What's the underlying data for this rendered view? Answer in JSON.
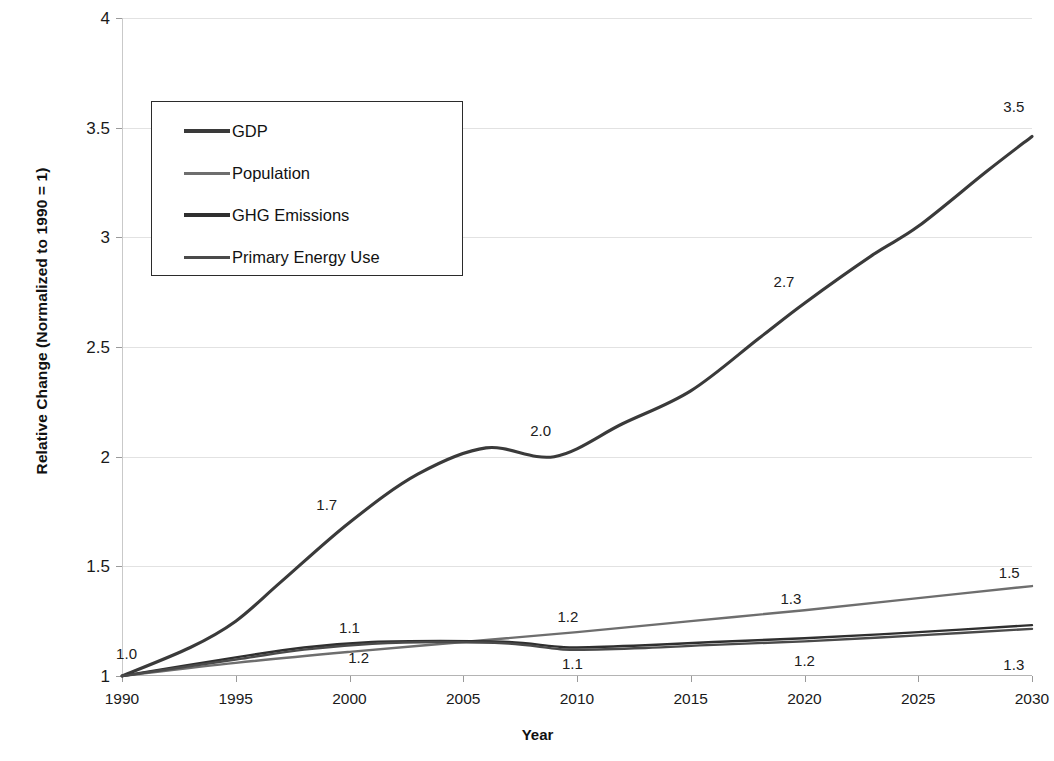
{
  "chart_data": {
    "type": "line",
    "title": "",
    "xlabel": "Year",
    "ylabel": "Relative Change (Normalized to 1990 = 1)",
    "xlim": [
      1990,
      2030
    ],
    "ylim": [
      1,
      4
    ],
    "xticks": [
      "1990",
      "1995",
      "2000",
      "2005",
      "2010",
      "2015",
      "2020",
      "2025",
      "2030"
    ],
    "yticks": [
      "1",
      "1.5",
      "2",
      "2.5",
      "3",
      "3.5",
      "4"
    ],
    "grid": "horizontal",
    "legend_position": "upper-left-inside",
    "x": [
      1990,
      1995,
      2000,
      2005,
      2010,
      2015,
      2020,
      2025,
      2030
    ],
    "series": [
      {
        "name": "GDP",
        "color": "#3a3a3a",
        "values": [
          1.0,
          1.25,
          1.7,
          2.0,
          2.0,
          2.3,
          2.7,
          3.05,
          3.46
        ],
        "points": [
          [
            1990,
            1.0
          ],
          [
            1993,
            1.13
          ],
          [
            1995,
            1.25
          ],
          [
            1997,
            1.43
          ],
          [
            2000,
            1.7
          ],
          [
            2003,
            1.92
          ],
          [
            2006,
            2.04
          ],
          [
            2009,
            2.0
          ],
          [
            2012,
            2.15
          ],
          [
            2015,
            2.3
          ],
          [
            2018,
            2.54
          ],
          [
            2020,
            2.7
          ],
          [
            2023,
            2.92
          ],
          [
            2025,
            3.05
          ],
          [
            2028,
            3.3
          ],
          [
            2030,
            3.46
          ]
        ]
      },
      {
        "name": "Population",
        "color": "#6e6e6e",
        "values": [
          1.0,
          1.06,
          1.11,
          1.15,
          1.2,
          1.25,
          1.3,
          1.36,
          1.41
        ],
        "points": [
          [
            1990,
            1.0
          ],
          [
            1995,
            1.06
          ],
          [
            2000,
            1.11
          ],
          [
            2005,
            1.155
          ],
          [
            2010,
            1.2
          ],
          [
            2015,
            1.25
          ],
          [
            2020,
            1.3
          ],
          [
            2025,
            1.355
          ],
          [
            2030,
            1.41
          ]
        ]
      },
      {
        "name": "GHG Emissions",
        "color": "#2f2f2f",
        "values": [
          1.0,
          1.08,
          1.14,
          1.16,
          1.13,
          1.15,
          1.17,
          1.2,
          1.23
        ],
        "points": [
          [
            1990,
            1.0
          ],
          [
            1995,
            1.085
          ],
          [
            1998,
            1.13
          ],
          [
            2001,
            1.155
          ],
          [
            2004,
            1.16
          ],
          [
            2007,
            1.155
          ],
          [
            2009,
            1.135
          ],
          [
            2010,
            1.13
          ],
          [
            2013,
            1.14
          ],
          [
            2016,
            1.155
          ],
          [
            2020,
            1.172
          ],
          [
            2025,
            1.2
          ],
          [
            2030,
            1.232
          ]
        ]
      },
      {
        "name": "Primary Energy Use",
        "color": "#4a4a4a",
        "values": [
          1.0,
          1.07,
          1.13,
          1.155,
          1.12,
          1.135,
          1.155,
          1.185,
          1.215
        ],
        "points": [
          [
            1990,
            1.0
          ],
          [
            1995,
            1.075
          ],
          [
            1998,
            1.12
          ],
          [
            2001,
            1.147
          ],
          [
            2004,
            1.155
          ],
          [
            2007,
            1.148
          ],
          [
            2009,
            1.125
          ],
          [
            2010,
            1.12
          ],
          [
            2013,
            1.128
          ],
          [
            2016,
            1.142
          ],
          [
            2020,
            1.158
          ],
          [
            2025,
            1.185
          ],
          [
            2030,
            1.215
          ]
        ]
      }
    ],
    "annotations": [
      {
        "text": "1.0",
        "x": 1990.2,
        "y": 1.105,
        "name": "label-1990-all"
      },
      {
        "text": "1.7",
        "x": 1999.0,
        "y": 1.785,
        "name": "label-2000-gdp"
      },
      {
        "text": "2.0",
        "x": 2008.4,
        "y": 2.12,
        "name": "label-2009-gdp"
      },
      {
        "text": "2.7",
        "x": 2019.1,
        "y": 2.8,
        "name": "label-2020-gdp"
      },
      {
        "text": "3.5",
        "x": 2029.2,
        "y": 3.6,
        "name": "label-2030-gdp"
      },
      {
        "text": "1.1",
        "x": 2000.0,
        "y": 1.225,
        "name": "label-2000-upper"
      },
      {
        "text": "1.2",
        "x": 2000.4,
        "y": 1.085,
        "name": "label-2000-lower"
      },
      {
        "text": "1.2",
        "x": 2009.6,
        "y": 1.275,
        "name": "label-2010-population"
      },
      {
        "text": "1.1",
        "x": 2009.8,
        "y": 1.058,
        "name": "label-2010-lower"
      },
      {
        "text": "1.3",
        "x": 2019.4,
        "y": 1.355,
        "name": "label-2020-population"
      },
      {
        "text": "1.2",
        "x": 2020.0,
        "y": 1.075,
        "name": "label-2020-lower"
      },
      {
        "text": "1.5",
        "x": 2029.0,
        "y": 1.475,
        "name": "label-2030-population"
      },
      {
        "text": "1.3",
        "x": 2029.2,
        "y": 1.055,
        "name": "label-2030-lower"
      }
    ]
  },
  "legend": {
    "items": [
      {
        "label": "GDP",
        "color": "#3a3a3a"
      },
      {
        "label": "Population",
        "color": "#6e6e6e"
      },
      {
        "label": "GHG Emissions",
        "color": "#2f2f2f"
      },
      {
        "label": "Primary Energy Use",
        "color": "#4a4a4a"
      }
    ]
  }
}
